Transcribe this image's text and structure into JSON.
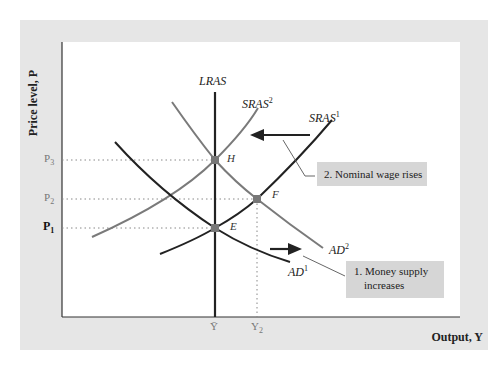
{
  "axes": {
    "y_label": "Price level, P",
    "x_label": "Output, Y",
    "y_ticks": [
      {
        "id": "P3",
        "base": "P",
        "sub": "3",
        "y": 160
      },
      {
        "id": "P2",
        "base": "P",
        "sub": "2",
        "y": 199
      },
      {
        "id": "P1",
        "base": "P",
        "sub": "1",
        "y": 228
      }
    ],
    "x_ticks": [
      {
        "id": "Ybar",
        "label": "Ȳ",
        "x": 215
      },
      {
        "id": "Y2",
        "base": "Y",
        "sub": "2",
        "x": 257
      }
    ]
  },
  "curves": {
    "lras": {
      "label": "LRAS"
    },
    "sras1": {
      "base": "SRAS",
      "sup": "1"
    },
    "sras2": {
      "base": "SRAS",
      "sup": "2"
    },
    "ad1": {
      "base": "AD",
      "sup": "1"
    },
    "ad2": {
      "base": "AD",
      "sup": "2"
    }
  },
  "points": {
    "H": "H",
    "F": "F",
    "E": "E"
  },
  "annotations": {
    "note1_line1": "1. Money supply",
    "note1_line2": "increases",
    "note2": "2. Nominal wage rises"
  },
  "colors": {
    "panel": "#e6e6e6",
    "note_box": "#d6d6d6",
    "dark_curve": "#222222",
    "gray_curve": "#777777",
    "point": "#777777"
  }
}
